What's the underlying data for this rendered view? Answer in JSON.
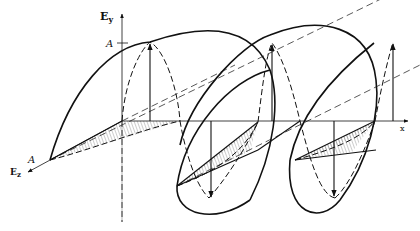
{
  "diagram": {
    "labels": {
      "ey_axis_main": "E",
      "ey_axis_sub": "y",
      "ez_axis_main": "E",
      "ez_axis_sub": "z",
      "x_axis": "x",
      "amplitude_y": "A",
      "amplitude_z": "A"
    },
    "colors": {
      "ink": "#111111",
      "hatch": "#555555",
      "background": "#ffffff"
    }
  }
}
